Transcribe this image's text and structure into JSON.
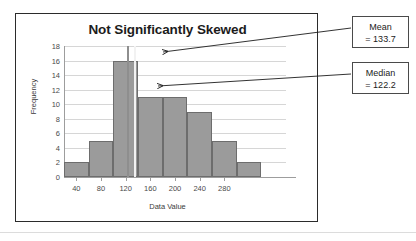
{
  "top_sliver_text": "",
  "figure": {
    "title": "Not Significantly Skewed",
    "x_axis_title": "Data Value",
    "y_axis_title": "Frequency"
  },
  "callouts": [
    {
      "name": "mean",
      "line1": "Mean",
      "line2": "= 133.7",
      "value": 133.7
    },
    {
      "name": "median",
      "line1": "Median",
      "line2": "= 122.2",
      "value": 122.2
    }
  ],
  "colors": {
    "bar_fill": "#9b9b9b",
    "bar_stroke": "#6d6d6d",
    "gridline": "#d6d6d6",
    "axis": "#9d9d9d",
    "frame": "#2b2b2b",
    "mean_line": "#f2f2f2",
    "median_line": "#8e8e8e"
  },
  "chart_data": {
    "type": "bar",
    "title": "Not Significantly Skewed",
    "xlabel": "Data Value",
    "ylabel": "Frequency",
    "xlim": [
      20,
      380
    ],
    "ylim": [
      0,
      18
    ],
    "y_ticks": [
      0,
      2,
      4,
      6,
      8,
      10,
      12,
      14,
      16,
      18
    ],
    "x_ticks": [
      40,
      80,
      120,
      160,
      200,
      240,
      280
    ],
    "grid": true,
    "legend": false,
    "bin_width": 40,
    "bin_edges": [
      20,
      60,
      100,
      140,
      180,
      220,
      260,
      300,
      340,
      380
    ],
    "categories": [
      "20-60",
      "60-100",
      "100-140",
      "140-180",
      "180-220",
      "220-260",
      "260-300",
      "300-340",
      "340-380"
    ],
    "values": [
      2,
      5,
      16,
      11,
      11,
      9,
      5,
      2,
      0
    ],
    "annotations": [
      {
        "label": "Mean",
        "value": 133.7,
        "text": "Mean = 133.7",
        "type": "vline"
      },
      {
        "label": "Median",
        "value": 122.2,
        "text": "Median = 122.2",
        "type": "vline"
      }
    ]
  }
}
